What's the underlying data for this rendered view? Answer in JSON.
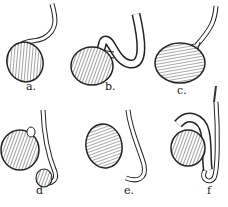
{
  "figure": {
    "panels": [
      {
        "id": "a",
        "label": "a."
      },
      {
        "id": "b",
        "label": "b."
      },
      {
        "id": "c",
        "label": "c."
      },
      {
        "id": "d",
        "label": "d"
      },
      {
        "id": "e",
        "label": "e."
      },
      {
        "id": "f",
        "label": "f"
      }
    ]
  }
}
